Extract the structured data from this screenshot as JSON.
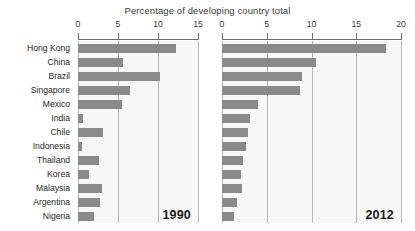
{
  "chart_data": {
    "type": "bar",
    "title": "Percentage of developing country total",
    "orientation": "horizontal",
    "xlabel": "Percentage of developing country total",
    "ylabel": "",
    "grid": true,
    "legend": "none",
    "categories": [
      "Hong Kong",
      "China",
      "Brazil",
      "Singapore",
      "Mexico",
      "India",
      "Chile",
      "Indonesia",
      "Thailand",
      "Korea",
      "Malaysia",
      "Argentina",
      "Nigeria"
    ],
    "panels": [
      {
        "name": "1990",
        "label": "1990",
        "xlim": [
          0,
          15
        ],
        "xticks": [
          0,
          5,
          10,
          15
        ],
        "xticklabels": [
          "0",
          "5",
          "10",
          "15"
        ],
        "values": [
          12.3,
          5.6,
          10.2,
          6.5,
          5.5,
          0.6,
          3.1,
          0.5,
          2.6,
          1.4,
          3.0,
          2.8,
          2.0
        ]
      },
      {
        "name": "2012",
        "label": "2012",
        "xlim": [
          0,
          20
        ],
        "xticks": [
          0,
          5,
          10,
          15,
          20
        ],
        "xticklabels": [
          "0",
          "5",
          "10",
          "15",
          "20"
        ],
        "values": [
          18.3,
          10.5,
          8.9,
          8.7,
          4.0,
          3.1,
          2.9,
          2.7,
          2.4,
          2.1,
          2.2,
          1.7,
          1.3
        ]
      }
    ],
    "series": [
      {
        "name": "1990",
        "values": [
          12.3,
          5.6,
          10.2,
          6.5,
          5.5,
          0.6,
          3.1,
          0.5,
          2.6,
          1.4,
          3.0,
          2.8,
          2.0
        ]
      },
      {
        "name": "2012",
        "values": [
          18.3,
          10.5,
          8.9,
          8.7,
          4.0,
          3.1,
          2.9,
          2.7,
          2.4,
          2.1,
          2.2,
          1.7,
          1.3
        ]
      }
    ],
    "colors": {
      "bar": "#8a8a8a",
      "plot_background": "#f7f7f7",
      "gridline": "#b9b9b9",
      "axis": "#6e6e6e",
      "text": "#262626",
      "title_text": "#3b3b3b"
    }
  }
}
